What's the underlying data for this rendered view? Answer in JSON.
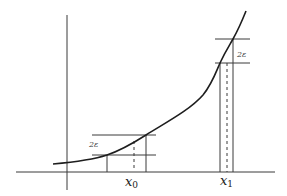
{
  "diagram": {
    "type": "function-continuity-illustration",
    "axes": {
      "x_axis": {
        "from": [
          16,
          172
        ],
        "to": [
          275,
          172
        ]
      },
      "y_axis": {
        "from": [
          67,
          15
        ],
        "to": [
          67,
          190
        ]
      }
    },
    "curve_points": [
      [
        53,
        164
      ],
      [
        80,
        161
      ],
      [
        107,
        155
      ],
      [
        130,
        146
      ],
      [
        146,
        135
      ],
      [
        175,
        117
      ],
      [
        200,
        100
      ],
      [
        213,
        84
      ],
      [
        220,
        63
      ],
      [
        233,
        39
      ],
      [
        246,
        11
      ]
    ],
    "neighborhoods": [
      {
        "id": "x0",
        "label_main": "x",
        "label_sub": "0",
        "epsilon_label": "2ε",
        "band_top_y": 135,
        "band_bottom_y": 155,
        "band_x_from": 92,
        "band_x_to": 156,
        "left_vertical_x": 107,
        "right_vertical_x": 146,
        "dashed_x": 134,
        "epsilon_label_pos": [
          89,
          147
        ],
        "x_label_pos": [
          125,
          186
        ]
      },
      {
        "id": "x1",
        "label_main": "x",
        "label_sub": "1",
        "epsilon_label": "2ε",
        "band_top_y": 39,
        "band_bottom_y": 63,
        "band_x_from": 215,
        "band_x_to": 250,
        "left_vertical_x": 220,
        "right_vertical_x": 233,
        "dashed_x": 227,
        "epsilon_label_pos": [
          237,
          57
        ],
        "x_label_pos": [
          220,
          185
        ]
      }
    ]
  },
  "labels": {
    "x0_main": "x",
    "x0_sub": "0",
    "x1_main": "x",
    "x1_sub": "1",
    "eps0": "2ε",
    "eps1": "2ε"
  }
}
